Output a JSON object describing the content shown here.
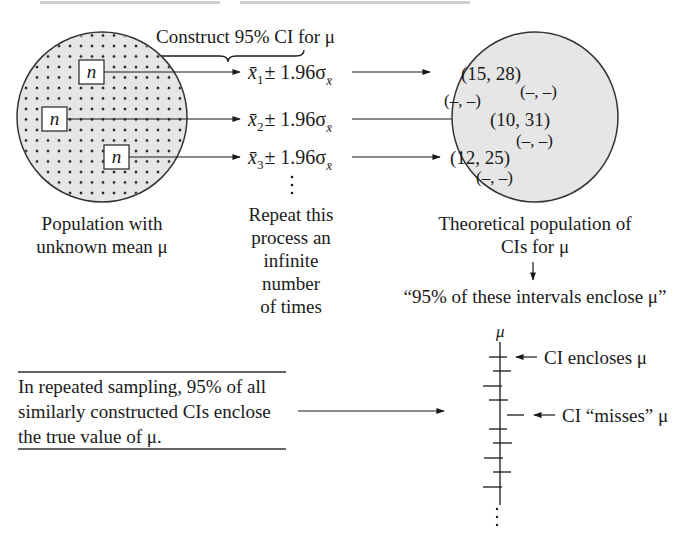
{
  "diagram": {
    "header_brace_label": "Construct 95% CI for μ",
    "population": {
      "sample_box_label": "n",
      "sample_count": 3,
      "caption_line1": "Population with",
      "caption_line2": "unknown mean μ",
      "fill_color": "#e6e6e6"
    },
    "formulas": [
      {
        "base": "x̄",
        "sub": "1",
        "rest": "± 1.96σ",
        "sub2": "x̄"
      },
      {
        "base": "x̄",
        "sub": "2",
        "rest": "± 1.96σ",
        "sub2": "x̄"
      },
      {
        "base": "x̄",
        "sub": "3",
        "rest": "± 1.96σ",
        "sub2": "x̄"
      }
    ],
    "repeat_caption": [
      "Repeat this",
      "process an",
      "infinite",
      "number",
      "of times"
    ],
    "ci_population": {
      "intervals": [
        "(15, 28)",
        "(10, 31)",
        "(12, 25)"
      ],
      "placeholders": [
        "(–, –)",
        "(–, –)",
        "(–, –)",
        "(–, –)"
      ],
      "caption_line1": "Theoretical population of",
      "caption_line2": "CIs for μ",
      "statement": "“95% of these intervals enclose μ”",
      "fill_color": "#e6e6e6"
    },
    "summary_box": {
      "line1": "In repeated sampling, 95% of all",
      "line2": "similarly constructed CIs enclose",
      "line3": "the true value of μ."
    },
    "ci_axis": {
      "axis_label": "μ",
      "annotation_encloses": "CI encloses μ",
      "annotation_misses": "CI “misses” μ"
    },
    "colors": {
      "ink": "#1a1a1a",
      "circle_fill": "#e6e6e6"
    }
  }
}
